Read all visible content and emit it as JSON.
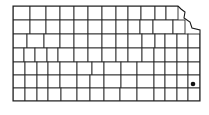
{
  "map": {
    "region": "Kansas",
    "type": "county-outline",
    "outline": "13,6 178,6 181,9 185,12 184,18 190,22 192,28 200,30 200,101 13,101",
    "rows": [
      {
        "y": 6,
        "h": 14,
        "xs": [
          13,
          30,
          46,
          60,
          74,
          88,
          102,
          116,
          128,
          141,
          155,
          166,
          178
        ]
      },
      {
        "y": 20,
        "h": 14,
        "xs": [
          13,
          30,
          46,
          60,
          74,
          88,
          102,
          116,
          128,
          140,
          153,
          173,
          185
        ]
      },
      {
        "y": 34,
        "h": 14,
        "xs": [
          13,
          27,
          44,
          60,
          74,
          88,
          102,
          116,
          128,
          142,
          155,
          165,
          177,
          188,
          200
        ]
      },
      {
        "y": 48,
        "h": 14,
        "xs": [
          13,
          24,
          35,
          47,
          58,
          74,
          88,
          102,
          116,
          128,
          142,
          154,
          165,
          177,
          188,
          200
        ]
      },
      {
        "y": 62,
        "h": 13,
        "xs": [
          13,
          25,
          37,
          48,
          60,
          77,
          92,
          104,
          121,
          137,
          154,
          165,
          177,
          188,
          200
        ]
      },
      {
        "y": 75,
        "h": 13,
        "xs": [
          13,
          25,
          37,
          48,
          60,
          77,
          90,
          104,
          121,
          137,
          154,
          165,
          177,
          188,
          200
        ]
      },
      {
        "y": 88,
        "h": 13,
        "xs": [
          13,
          25,
          37,
          48,
          61,
          77,
          90,
          104,
          120,
          137,
          154,
          165,
          177,
          188,
          200
        ]
      }
    ],
    "markers": [
      {
        "label": "occurrence",
        "x": 193,
        "y": 84,
        "r": 2.3,
        "color": "#111111"
      }
    ]
  }
}
